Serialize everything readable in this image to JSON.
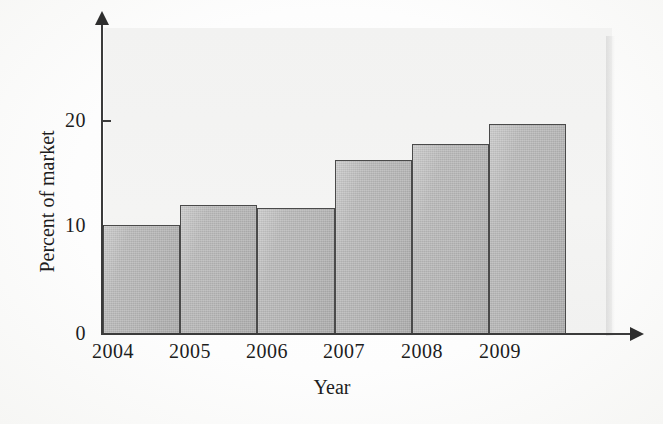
{
  "chart_data": {
    "type": "bar",
    "title": "",
    "subtitle": "",
    "xlabel": "Year",
    "ylabel": "Percent of market",
    "categories": [
      "2004",
      "2005",
      "2006",
      "2007",
      "2008",
      "2009"
    ],
    "values": [
      10.0,
      11.8,
      11.6,
      16.0,
      17.4,
      19.3
    ],
    "series": [
      {
        "name": "Percent of market",
        "values": [
          10.0,
          11.8,
          11.6,
          16.0,
          17.4,
          19.3
        ]
      }
    ],
    "ylim": [
      0,
      26
    ],
    "xlim_note": "categorical, 6 adjacent bars with no gaps",
    "yticks": [
      0,
      10,
      20
    ],
    "ytick_labels": [
      "0",
      "10",
      "20"
    ],
    "xtick_labels": [
      "2004",
      "2005",
      "2006",
      "2007",
      "2008",
      "2009"
    ],
    "grid": false,
    "legend": null,
    "legend_position": "none",
    "annotations": [],
    "axis_style": "arrow-terminated axes",
    "colors": {
      "bar_fill": "#b4b4b4",
      "bar_edge": "#4a4a4a",
      "axis": "#3b3b3b",
      "text": "#1d1d1d",
      "plot_panel": "#f2f2f1",
      "page_background": "#fdfdfd"
    }
  },
  "axes": {
    "y_ticks": [
      {
        "label": "20",
        "value": 20
      },
      {
        "label": "10",
        "value": 10
      },
      {
        "label": "0",
        "value": 0
      }
    ],
    "x_title": "Year",
    "y_title": "Percent of market"
  }
}
